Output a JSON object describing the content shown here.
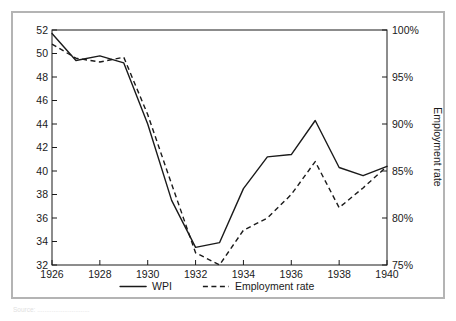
{
  "chart_data": {
    "type": "line",
    "title": "",
    "xlabel": "",
    "ylabel": "",
    "y2label": "Employment rate",
    "x": [
      1926,
      1927,
      1928,
      1929,
      1930,
      1931,
      1932,
      1933,
      1934,
      1935,
      1936,
      1937,
      1938,
      1939,
      1940
    ],
    "xtick_labels": [
      "1926",
      "1928",
      "1930",
      "1932",
      "1934",
      "1936",
      "1938",
      "1940"
    ],
    "xtick_values": [
      1926,
      1928,
      1930,
      1932,
      1934,
      1936,
      1938,
      1940
    ],
    "xlim": [
      1926,
      1940
    ],
    "ylim": [
      32,
      52
    ],
    "ytick_labels": [
      "32",
      "34",
      "36",
      "38",
      "40",
      "42",
      "44",
      "46",
      "48",
      "50",
      "52"
    ],
    "ytick_values": [
      32,
      34,
      36,
      38,
      40,
      42,
      44,
      46,
      48,
      50,
      52
    ],
    "y2lim": [
      75,
      100
    ],
    "y2tick_labels": [
      "75%",
      "80%",
      "85%",
      "90%",
      "95%",
      "100%"
    ],
    "y2tick_values": [
      75,
      80,
      85,
      90,
      95,
      100
    ],
    "grid": false,
    "legend_position": "bottom",
    "series": [
      {
        "name": "WPI",
        "axis": "left",
        "style": "solid",
        "values": [
          51.7,
          49.4,
          49.8,
          49.2,
          44.0,
          37.5,
          33.5,
          33.9,
          38.5,
          41.2,
          41.4,
          44.3,
          40.3,
          39.6,
          40.4
        ]
      },
      {
        "name": "Employment rate",
        "axis": "right",
        "style": "dashed",
        "values": [
          98.5,
          97.0,
          96.6,
          97.1,
          91.0,
          83.6,
          76.3,
          75.0,
          78.7,
          80.0,
          82.5,
          86.0,
          81.1,
          83.2,
          85.5
        ]
      }
    ]
  },
  "legend": {
    "items": [
      {
        "label": "WPI",
        "style": "solid"
      },
      {
        "label": "Employment rate",
        "style": "dashed"
      }
    ]
  },
  "caption": {
    "source_text": "Source: ............................."
  }
}
